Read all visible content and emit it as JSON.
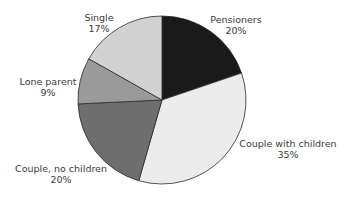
{
  "chart_data": {
    "type": "pie",
    "title": "",
    "categories": [
      "Pensioners",
      "Couple with children",
      "Couple, no children",
      "Lone parent",
      "Single"
    ],
    "values": [
      20,
      35,
      20,
      9,
      17
    ],
    "unit": "%",
    "start_angle": "12 o'clock",
    "direction": "clockwise",
    "colors": [
      "#1a1a1a",
      "#ececec",
      "#6e6e6e",
      "#9a9a9a",
      "#d2d2d2"
    ],
    "legend": "none (direct labels)"
  },
  "labels": [
    {
      "name": "Pensioners",
      "pct": "20%",
      "x": 236,
      "y": 14
    },
    {
      "name": "Couple with children",
      "pct": "35%",
      "x": 288,
      "y": 138
    },
    {
      "name": "Couple, no children",
      "pct": "20%",
      "x": 61,
      "y": 163
    },
    {
      "name": "Lone parent",
      "pct": "9%",
      "x": 48,
      "y": 76
    },
    {
      "name": "Single",
      "pct": "17%",
      "x": 99,
      "y": 12
    }
  ]
}
